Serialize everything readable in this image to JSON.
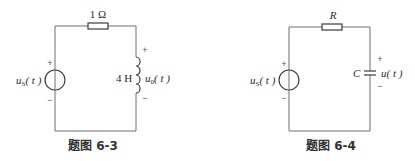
{
  "figures": [
    {
      "caption": "题图 6-3",
      "resistor_label": "1 Ω",
      "source_label": "u",
      "source_sub": "S",
      "source_arg": "( t )",
      "source_plus": "+",
      "source_minus": "−",
      "element_type": "inductor",
      "element_label": "4 H",
      "voltage_label": "u",
      "voltage_sub": "0",
      "voltage_arg": "( t )",
      "voltage_plus": "+",
      "voltage_minus": "−"
    },
    {
      "caption": "题图 6-4",
      "resistor_label": "R",
      "source_label": "u",
      "source_sub": "S",
      "source_arg": "( t )",
      "source_plus": "+",
      "source_minus": "−",
      "element_type": "capacitor",
      "element_label": "C",
      "voltage_label": "u",
      "voltage_arg": "( t )",
      "voltage_plus": "+",
      "voltage_minus": "−"
    }
  ],
  "colors": {
    "wire": "#6f6f6f",
    "component": "#3a3a3a",
    "text": "#2a2a2a"
  }
}
